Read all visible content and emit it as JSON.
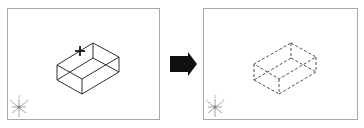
{
  "diagram": {
    "panels": [
      {
        "id": "before",
        "label": "Unselected 3D box with pick cursor",
        "box_style": "solid",
        "line_color": "#303030",
        "cursor": "crosshair-plus"
      },
      {
        "id": "after",
        "label": "Selected 3D box shown dashed (highlighted)",
        "box_style": "dashed",
        "line_color": "#505050"
      }
    ],
    "arrow": {
      "direction": "right",
      "color": "#111111",
      "meaning": "transition"
    },
    "ucs_icon": {
      "name": "ucs-axis-icon",
      "axes": [
        "X",
        "Y",
        "Z"
      ]
    },
    "colors": {
      "frame": "#a8a8a8",
      "background": "#ffffff",
      "solid_line": "#303030",
      "dashed_line": "#505050",
      "arrow": "#111111"
    }
  }
}
